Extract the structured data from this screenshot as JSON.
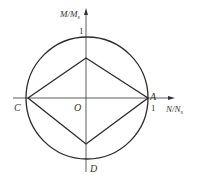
{
  "diagram": {
    "y_axis_label": "M/M",
    "y_axis_sub": "s",
    "x_axis_label": "N/N",
    "x_axis_sub": "s",
    "tick_y": "1",
    "tick_x": "1",
    "points": {
      "origin": "O",
      "A": "A",
      "C": "C",
      "D": "D"
    },
    "colors": {
      "stroke": "#2a2a2a",
      "text": "#333333"
    }
  }
}
